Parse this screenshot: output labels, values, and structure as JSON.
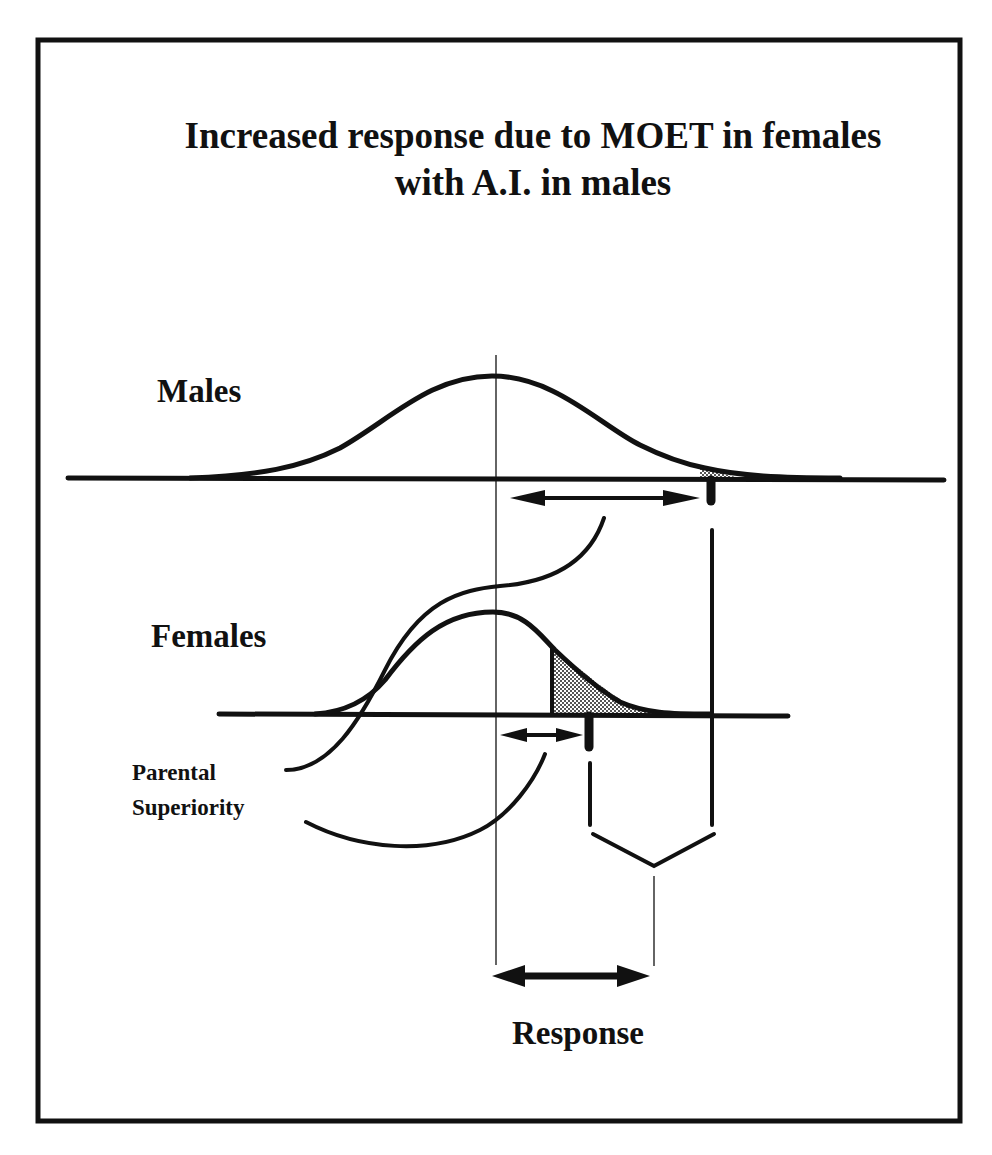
{
  "title": {
    "line1": "Increased response due to MOET in females",
    "line2": "with A.I. in males"
  },
  "labels": {
    "males": "Males",
    "females": "Females",
    "parental_line1": "Parental",
    "parental_line2": "Superiority",
    "response": "Response"
  },
  "colors": {
    "ink": "#111111",
    "background": "#ffffff",
    "shading": "#bbbbbb"
  },
  "diagram": {
    "elements": [
      "males-normal-curve",
      "females-normal-curve",
      "shaded-selected-tail-males",
      "shaded-selected-tail-females",
      "males-selection-differential-arrow",
      "females-selection-differential-arrow",
      "parental-superiority-braces",
      "response-bracket",
      "response-arrow"
    ]
  }
}
